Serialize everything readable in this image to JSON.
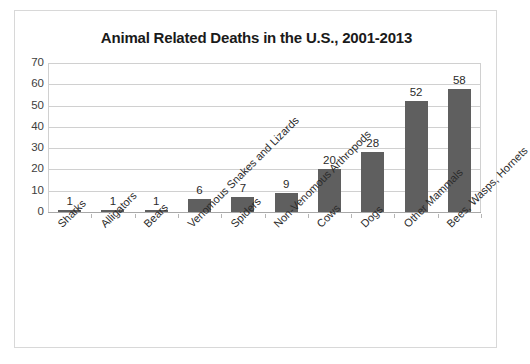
{
  "chart_data": {
    "type": "bar",
    "title": "Animal Related Deaths in the U.S., 2001-2013",
    "xlabel": "",
    "ylabel": "",
    "categories": [
      "Sharks",
      "Alligators",
      "Bears",
      "Venomous Snakes and Lizards",
      "Spiders",
      "Non-Venomous Arthropods",
      "Cows",
      "Dogs",
      "Other Mammals",
      "Bees, Wasps, Hornets"
    ],
    "values": [
      1,
      1,
      1,
      6,
      7,
      9,
      20,
      28,
      52,
      58
    ],
    "value_labels": [
      "1",
      "1",
      "1",
      "6",
      "7",
      "9",
      "20",
      "28",
      "52",
      "58"
    ],
    "ylim": [
      0,
      70
    ],
    "ytick_labels": [
      "70",
      "60",
      "50",
      "40",
      "30",
      "20",
      "10",
      "0"
    ],
    "ytick_values": [
      70,
      60,
      50,
      40,
      30,
      20,
      10,
      0
    ],
    "grid": true,
    "legend": false,
    "bar_color": "#5f5f5f",
    "gridline_color": "#d0d0d0",
    "axis_color": "#a8a8a8",
    "title_color": "#1a1a1a",
    "background": "#ffffff",
    "border_color": "#d8d8d8"
  }
}
